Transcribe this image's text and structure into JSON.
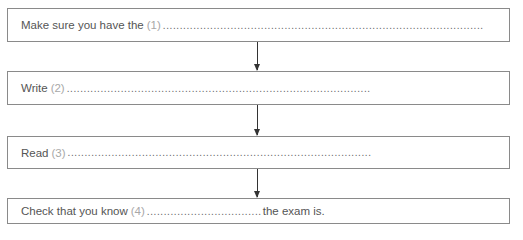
{
  "steps": [
    {
      "prefix": "Make sure you have the",
      "number": "(1)",
      "dots": "...............................................................................................",
      "suffix": ""
    },
    {
      "prefix": "Write",
      "number": "(2)",
      "dots": "..........................................................................................",
      "suffix": ""
    },
    {
      "prefix": "Read",
      "number": "(3)",
      "dots": "..........................................................................................",
      "suffix": ""
    },
    {
      "prefix": "Check that you know",
      "number": "(4)",
      "dots": "..................................",
      "suffix": "the exam is."
    }
  ],
  "colors": {
    "border": "#8a8a8a",
    "text": "#555555",
    "number": "#a8a8a8",
    "arrow": "#333333"
  }
}
